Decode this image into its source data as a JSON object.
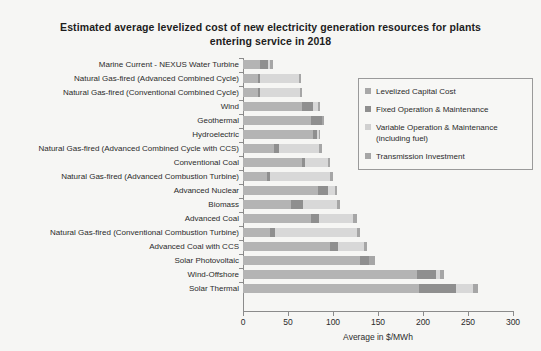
{
  "chart_data": {
    "type": "bar",
    "orientation": "horizontal",
    "stacked": true,
    "title": "Estimated average levelized cost of new electricity generation resources for plants entering service in 2018",
    "xlabel": "Average in $/MWh",
    "ylabel": "",
    "xlim": [
      0,
      300
    ],
    "xticks": [
      0,
      50,
      100,
      150,
      200,
      250,
      300
    ],
    "grid": false,
    "legend_position": "upper right",
    "categories": [
      "Marine Current - NEXUS Water Turbine",
      "Natural Gas-fired (Advanced Combined Cycle)",
      "Natural Gas-fired (Conventional Combined Cycle)",
      "Wind",
      "Geothermal",
      "Hydroelectric",
      "Natural Gas-fired (Advanced Combined Cycle with CCS)",
      "Conventional Coal",
      "Natural Gas-fired (Advanced Combustion Turbine)",
      "Advanced Nuclear",
      "Biomass",
      "Advanced Coal",
      "Natural Gas-fired (Conventional Combustion Turbine)",
      "Advanced Coal with CCS",
      "Solar Photovoltaic",
      "Wind-Offshore",
      "Solar Thermal"
    ],
    "series": [
      {
        "name": "Levelized Capital Cost",
        "key": "cap",
        "color": "#b4b4b4",
        "values": [
          19,
          17,
          17,
          65,
          76,
          78,
          34,
          65,
          27,
          83,
          53,
          75,
          30,
          97,
          130,
          193,
          195
        ]
      },
      {
        "name": "Fixed Operation & Maintenance",
        "key": "fom",
        "color": "#8f8f8f",
        "values": [
          9,
          2,
          2,
          13,
          12,
          4,
          6,
          4,
          3,
          12,
          14,
          9,
          6,
          9,
          10,
          22,
          42
        ]
      },
      {
        "name": "Variable Operation & Maintenance (including fuel)",
        "key": "vom",
        "color": "#d8d8d8",
        "values": [
          2,
          43,
          44,
          5,
          0,
          2,
          45,
          26,
          67,
          7,
          38,
          38,
          91,
          29,
          0,
          4,
          19
        ]
      },
      {
        "name": "Transmission Investment",
        "key": "tra",
        "color": "#a6a6a6",
        "values": [
          3,
          3,
          3,
          3,
          2,
          2,
          3,
          2,
          3,
          2,
          3,
          5,
          3,
          3,
          7,
          4,
          5
        ]
      }
    ],
    "totals": [
      33,
      65,
      66,
      86,
      90,
      86,
      88,
      97,
      100,
      104,
      108,
      127,
      130,
      138,
      147,
      223,
      261
    ]
  },
  "legend": {
    "items": [
      "Levelized Capital Cost",
      "Fixed Operation & Maintenance",
      "Variable Operation & Maintenance (including fuel)",
      "Transmission Investment"
    ]
  }
}
